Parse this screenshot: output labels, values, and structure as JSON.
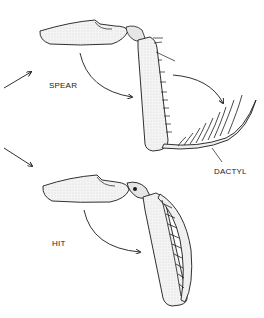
{
  "figure": {
    "labels": {
      "spear": "SPEAR",
      "hit": "HIT",
      "dactyl": "DACTYL"
    },
    "panels": [
      {
        "id": "spear",
        "label": "SPEAR",
        "description": "Spearing appendage with long spined dactyl swinging outward"
      },
      {
        "id": "hit",
        "label": "HIT",
        "description": "Smashing appendage with dactyl folded against propodus"
      }
    ],
    "colors": {
      "ink": "#1a1a1a",
      "shading": "#d9d9d9",
      "fill": "#f2f2f2",
      "background": "#ffffff"
    }
  }
}
